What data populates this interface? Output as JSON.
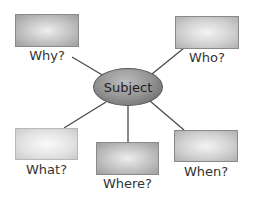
{
  "diagram": {
    "type": "mind-map",
    "center": {
      "label": "Subject"
    },
    "nodes": [
      {
        "id": "why",
        "label": "Why?"
      },
      {
        "id": "who",
        "label": "Who?"
      },
      {
        "id": "what",
        "label": "What?"
      },
      {
        "id": "where",
        "label": "Where?"
      },
      {
        "id": "when",
        "label": "When?"
      }
    ],
    "colors": {
      "line": "#4a4a4a",
      "center_fill": "#8f8f8f",
      "box_fill": "#c8c8c8",
      "text": "#333333"
    }
  }
}
